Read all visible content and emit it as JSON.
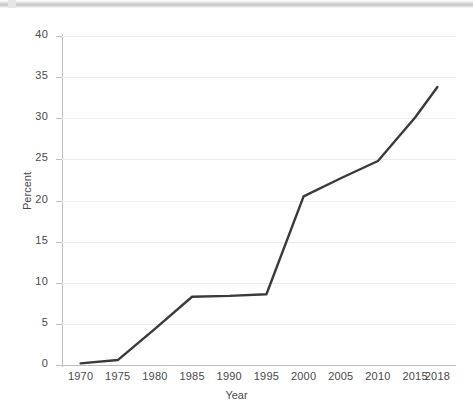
{
  "window": {
    "top_strip": "toolbar-edge"
  },
  "chart_data": {
    "type": "line",
    "title": "",
    "subtitle": "",
    "xlabel": "Year",
    "ylabel": "Percent",
    "categories": [
      "1970",
      "1975",
      "1980",
      "1985",
      "1990",
      "1995",
      "2000",
      "2005",
      "2010",
      "2015",
      "2018"
    ],
    "x": [
      1970,
      1975,
      1980,
      1985,
      1990,
      1995,
      2000,
      2005,
      2010,
      2015,
      2018
    ],
    "values": [
      0.2,
      0.6,
      4.4,
      8.3,
      8.4,
      8.6,
      20.5,
      22.7,
      24.8,
      30.1,
      33.8
    ],
    "series": [
      {
        "name": "Percent",
        "color": "#3a3a3a",
        "values": [
          0.2,
          0.6,
          4.4,
          8.3,
          8.4,
          8.6,
          20.5,
          22.7,
          24.8,
          30.1,
          33.8
        ]
      }
    ],
    "xlim": [
      1967.5,
      2020.5
    ],
    "ylim": [
      0,
      40
    ],
    "yticks": [
      0,
      5,
      10,
      15,
      20,
      25,
      30,
      35,
      40
    ],
    "ytick_labels": [
      "0",
      "5",
      "10",
      "15",
      "20",
      "25",
      "30",
      "35",
      "40"
    ],
    "xtick_labels": [
      "1970",
      "1975",
      "1980",
      "1985",
      "1990",
      "1995",
      "2000",
      "2005",
      "2010",
      "2015",
      "2018"
    ],
    "grid": "horizontal",
    "grid_color": "#ececec",
    "legend": "none",
    "line_width": 2.4,
    "markers": "none",
    "background": "#ffffff",
    "axis_color": "#bfbfbf",
    "text_color": "#4a4a4a"
  }
}
